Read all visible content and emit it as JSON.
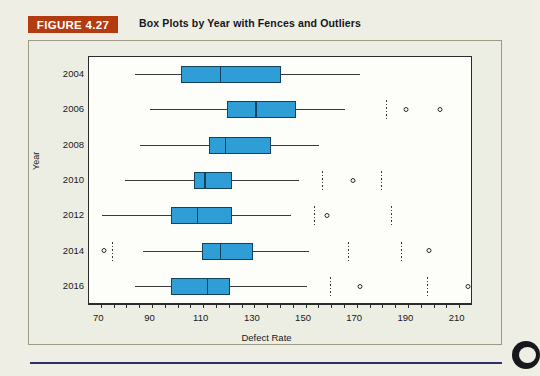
{
  "figure": {
    "label": "FIGURE 4.27",
    "title": "Box Plots by Year with Fences and Outliers",
    "label_color": "#b23c10",
    "rule_color": "#2b2f6b"
  },
  "chart_data": {
    "type": "box",
    "title": "Box Plots by Year with Fences and Outliers",
    "xlabel": "Defect Rate",
    "ylabel": "Year",
    "xlim": [
      66,
      216
    ],
    "x_ticks": [
      70,
      90,
      110,
      130,
      150,
      170,
      190,
      210
    ],
    "x_minor_step": 5,
    "grid": false,
    "legend": "none",
    "box_fill": "#2f9ed6",
    "box_edge": "#14425e",
    "categories": [
      "2004",
      "2006",
      "2008",
      "2010",
      "2012",
      "2014",
      "2016"
    ],
    "boxes": [
      {
        "year": "2004",
        "whisker_low": 84,
        "q1": 102,
        "median": 117,
        "q3": 141,
        "whisker_high": 172,
        "fences": [],
        "outliers": []
      },
      {
        "year": "2006",
        "whisker_low": 90,
        "q1": 120,
        "median": 131,
        "q3": 147,
        "whisker_high": 166,
        "fences": [
          182
        ],
        "outliers": [
          190,
          203
        ]
      },
      {
        "year": "2008",
        "whisker_low": 86,
        "q1": 113,
        "median": 119,
        "q3": 137,
        "whisker_high": 156,
        "fences": [],
        "outliers": []
      },
      {
        "year": "2010",
        "whisker_low": 80,
        "q1": 107,
        "median": 111,
        "q3": 122,
        "whisker_high": 148,
        "fences": [
          157,
          180
        ],
        "outliers": [
          169
        ]
      },
      {
        "year": "2012",
        "whisker_low": 71,
        "q1": 98,
        "median": 108,
        "q3": 122,
        "whisker_high": 145,
        "fences": [
          154,
          184
        ],
        "outliers": [
          159
        ]
      },
      {
        "year": "2014",
        "whisker_low": 87,
        "q1": 110,
        "median": 117,
        "q3": 130,
        "whisker_high": 152,
        "fences": [
          75,
          167,
          188
        ],
        "outliers": [
          72,
          199
        ]
      },
      {
        "year": "2016",
        "whisker_low": 84,
        "q1": 98,
        "median": 112,
        "q3": 121,
        "whisker_high": 151,
        "fences": [
          160,
          198
        ],
        "outliers": [
          172,
          214
        ]
      }
    ]
  }
}
